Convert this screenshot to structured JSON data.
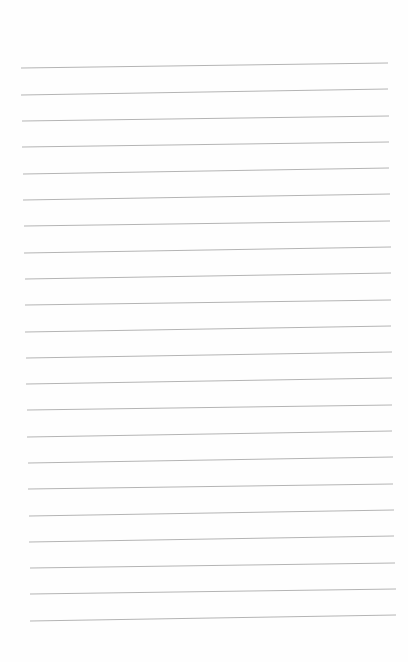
{
  "page": {
    "type": "lined-paper",
    "background_color": "#fefefe",
    "line_color": "#b4b4b4",
    "line_count": 22,
    "lines": [
      {
        "x1": 21,
        "y1": 68,
        "x2": 388,
        "y2": 63
      },
      {
        "x1": 21,
        "y1": 95,
        "x2": 388,
        "y2": 89
      },
      {
        "x1": 22,
        "y1": 121,
        "x2": 389,
        "y2": 116
      },
      {
        "x1": 22,
        "y1": 147,
        "x2": 389,
        "y2": 142
      },
      {
        "x1": 23,
        "y1": 174,
        "x2": 389,
        "y2": 168
      },
      {
        "x1": 23,
        "y1": 200,
        "x2": 390,
        "y2": 194
      },
      {
        "x1": 24,
        "y1": 226,
        "x2": 390,
        "y2": 221
      },
      {
        "x1": 24,
        "y1": 253,
        "x2": 391,
        "y2": 247
      },
      {
        "x1": 25,
        "y1": 279,
        "x2": 391,
        "y2": 273
      },
      {
        "x1": 25,
        "y1": 305,
        "x2": 391,
        "y2": 300
      },
      {
        "x1": 25,
        "y1": 332,
        "x2": 391,
        "y2": 326
      },
      {
        "x1": 26,
        "y1": 358,
        "x2": 392,
        "y2": 352
      },
      {
        "x1": 26,
        "y1": 384,
        "x2": 392,
        "y2": 378
      },
      {
        "x1": 27,
        "y1": 410,
        "x2": 392,
        "y2": 405
      },
      {
        "x1": 27,
        "y1": 437,
        "x2": 392,
        "y2": 431
      },
      {
        "x1": 28,
        "y1": 463,
        "x2": 393,
        "y2": 457
      },
      {
        "x1": 28,
        "y1": 489,
        "x2": 393,
        "y2": 484
      },
      {
        "x1": 29,
        "y1": 516,
        "x2": 394,
        "y2": 510
      },
      {
        "x1": 29,
        "y1": 542,
        "x2": 394,
        "y2": 536
      },
      {
        "x1": 30,
        "y1": 568,
        "x2": 395,
        "y2": 563
      },
      {
        "x1": 30,
        "y1": 594,
        "x2": 396,
        "y2": 589
      },
      {
        "x1": 30,
        "y1": 621,
        "x2": 396,
        "y2": 615
      }
    ]
  }
}
